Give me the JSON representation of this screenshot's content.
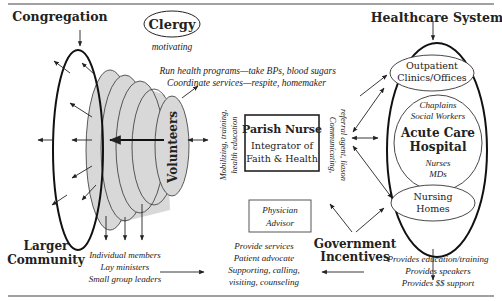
{
  "title_left": "Congregation",
  "title_right": "Healthcare System",
  "clergy": {
    "label": "Clergy",
    "action": "motivating"
  },
  "volunteers": "Volunteers",
  "larger_community": [
    "Larger",
    "Community"
  ],
  "health_programs": [
    "Run health programs—take BPs, blood sugars",
    "Coordinate services—respite, homemaker"
  ],
  "parish_nurse": {
    "title": "Parish Nurse",
    "subtitle_1": "Integrator of",
    "subtitle_2": "Faith & Health"
  },
  "left_side_label": [
    "Mobilizing, training,",
    "health education"
  ],
  "right_side_label": [
    "Communicating,",
    "referral agent, liason"
  ],
  "physician_advisor": [
    "Physician",
    "Advisor"
  ],
  "government": [
    "Government",
    "Incentives"
  ],
  "healthcare": {
    "outpatient": [
      "Outpatient",
      "Clinics/Offices"
    ],
    "staff_top": [
      "Chaplains",
      "Social Workers"
    ],
    "hospital": [
      "Acute Care",
      "Hospital"
    ],
    "staff_bottom": [
      "Nurses",
      "MDs"
    ],
    "nursing": [
      "Nursing",
      "Homes"
    ]
  },
  "members": [
    "Individual members",
    "Lay ministers",
    "Small group leaders"
  ],
  "services": [
    "Provide services",
    "Patient advocate",
    "Supporting, calling,",
    "visiting, counseling"
  ],
  "provides": [
    "Provides education/training",
    "Provides speakers",
    "Provides $$ support"
  ],
  "colors": {
    "ink": "#222222",
    "shade": "#d6d6d6"
  }
}
